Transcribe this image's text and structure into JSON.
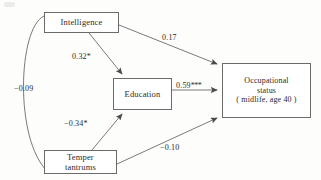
{
  "figure": {
    "type": "path-diagram",
    "background_color": "#fdfdfc",
    "line_color": "#6b6b6b",
    "text_color": "#2b2b2b"
  },
  "nodes": [
    {
      "id": "intelligence",
      "label": "Intelligence"
    },
    {
      "id": "education",
      "label": "Education"
    },
    {
      "id": "occupational_status",
      "label": "Occupational\nstatus\n( midlife, age 40 )"
    },
    {
      "id": "temper_tantrums",
      "label": "Temper\ntantrums"
    }
  ],
  "edges": [
    {
      "id": "intelligence-temper-correlation",
      "from": "intelligence",
      "to": "temper_tantrums",
      "label": "−0.09",
      "coefficient": -0.09,
      "stars": "",
      "arrow": "none",
      "style": "curved"
    },
    {
      "id": "intelligence-education",
      "from": "intelligence",
      "to": "education",
      "label": "0.32",
      "coefficient": 0.32,
      "stars": "*",
      "arrow": "single",
      "style": "straight"
    },
    {
      "id": "intelligence-occupational",
      "from": "intelligence",
      "to": "occupational_status",
      "label": "0.17",
      "coefficient": 0.17,
      "stars": "",
      "arrow": "single",
      "style": "straight"
    },
    {
      "id": "education-occupational",
      "from": "education",
      "to": "occupational_status",
      "label": "0.59",
      "coefficient": 0.59,
      "stars": "***",
      "arrow": "single",
      "style": "straight"
    },
    {
      "id": "temper-education",
      "from": "temper_tantrums",
      "to": "education",
      "label": "−0.34",
      "coefficient": -0.34,
      "stars": "*",
      "arrow": "single",
      "style": "straight"
    },
    {
      "id": "temper-occupational",
      "from": "temper_tantrums",
      "to": "occupational_status",
      "label": "−0.10",
      "coefficient": -0.1,
      "stars": "",
      "arrow": "single",
      "style": "straight"
    }
  ]
}
